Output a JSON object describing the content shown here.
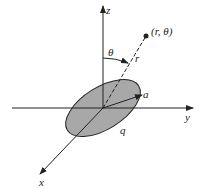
{
  "diagram": {
    "axes": {
      "x": "x",
      "y": "y",
      "z": "z"
    },
    "point_label": "(r, θ)",
    "angle_label": "θ",
    "radius_label": "r",
    "disk_radius_label": "a",
    "charge_label": "q",
    "colors": {
      "disk_fill": "#a8a8a8",
      "line": "#222222"
    }
  }
}
